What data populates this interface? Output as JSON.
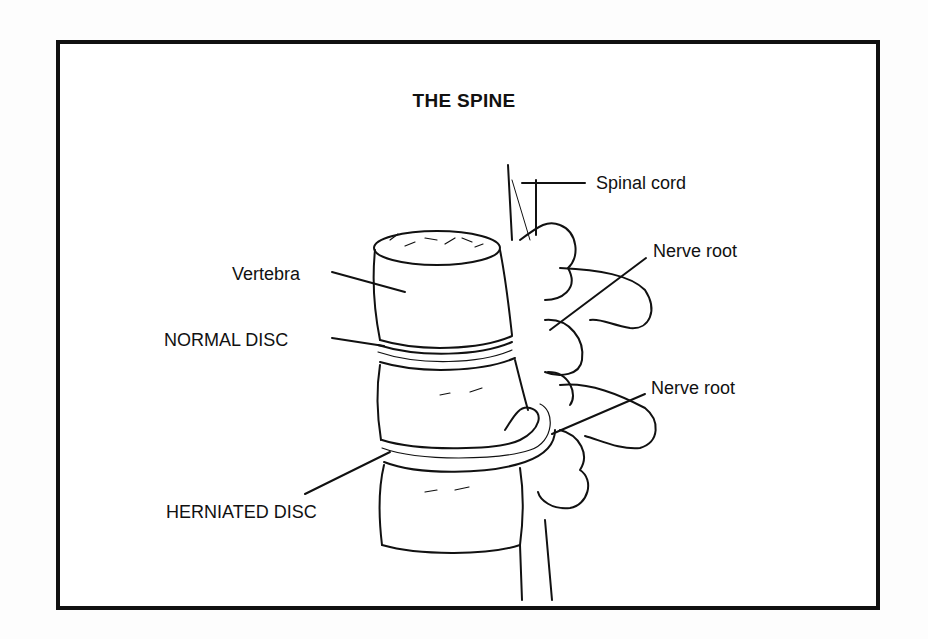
{
  "diagram": {
    "title": "THE SPINE",
    "labels": {
      "spinal_cord": "Spinal cord",
      "nerve_root_upper": "Nerve root",
      "vertebra": "Vertebra",
      "normal_disc": "NORMAL DISC",
      "nerve_root_lower": "Nerve root",
      "herniated_disc": "HERNIATED DISC"
    },
    "colors": {
      "ink": "#111111",
      "paper": "#ffffff",
      "background": "#fdfdfd"
    }
  }
}
